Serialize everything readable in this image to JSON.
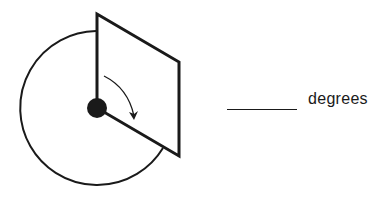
{
  "diagram": {
    "unit_label": "degrees",
    "answer_blank": "",
    "colors": {
      "stroke": "#1a1a1a",
      "background": "#ffffff"
    },
    "elements": [
      "circle",
      "pivot-dot",
      "panel-parallelogram",
      "rotation-arrow",
      "answer-blank",
      "unit-label"
    ]
  }
}
